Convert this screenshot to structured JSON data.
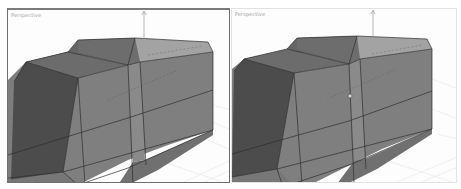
{
  "viewports": [
    {
      "id": "left",
      "label": "Perspective",
      "active": true,
      "border_color": "#6e6e6e"
    },
    {
      "id": "right",
      "label": "Perspective",
      "active": false,
      "border_color": "#e2e2e2",
      "has_gizmo_marker": true
    }
  ],
  "colors": {
    "viewport_bg": "#fdfdfd",
    "grid": "#e6e6e6",
    "face_dark": "#4e4e4e",
    "face_mid": "#7b7b7b",
    "face_light": "#8e8e8e",
    "face_top": "#6a6a6a",
    "face_bevel": "#a4a4a4",
    "edge": "#2e2e2e"
  }
}
